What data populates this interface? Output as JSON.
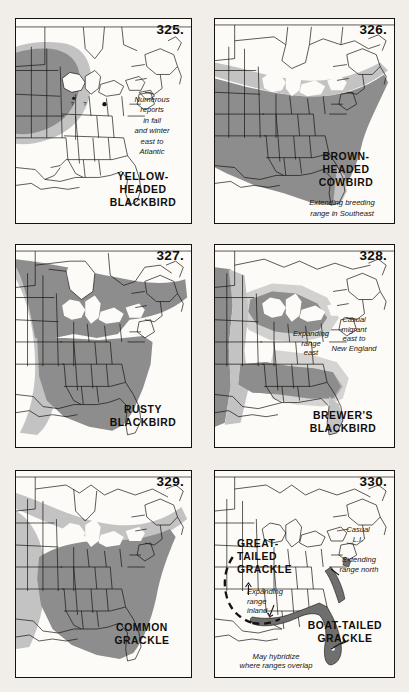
{
  "page": {
    "background_color": "#f1ede8",
    "panel_background": "#fdfbf8",
    "ink_color": "#16130f",
    "shade_dark": "#8b8b8b",
    "shade_light": "#bdbdbd",
    "shade_mid": "#a3a3a3",
    "layout": "2 columns x 3 rows of bird range maps"
  },
  "panels": [
    {
      "number": "325.",
      "species": "YELLOW-\nHEADED\nBLACKBIRD",
      "notes": [
        "Numerous\nreports\nin fall\nand winter\neast to\nAtlantic"
      ],
      "range_shading": "dark gray over upper Great Plains / upper Midwest, light gray halo extending east"
    },
    {
      "number": "326.",
      "species": "BROWN-\nHEADED\nCOWBIRD",
      "notes": [
        "Extending breeding\nrange in Southeast"
      ],
      "range_shading": "dark gray over most of eastern and central United States, light gray band across southern Canada, light gray wedge over Florida"
    },
    {
      "number": "327.",
      "species": "RUSTY\nBLACKBIRD",
      "notes": [],
      "range_shading": "dark gray across boreal Canada and down the eastern United States, light gray across the Great Plains"
    },
    {
      "number": "328.",
      "species": "BREWER'S\nBLACKBIRD",
      "notes": [
        "Expanding\nrange\neast",
        "Casual\nmigrant\neast to\nNew England"
      ],
      "range_shading": "dark gray over the western Great Lakes and Gulf coast states, light gray expansion zone eastward"
    },
    {
      "number": "329.",
      "species": "COMMON\nGRACKLE",
      "notes": [],
      "range_shading": "dark gray over eastern United States, light gray band over southern Canada and Great Plains"
    },
    {
      "number": "330.",
      "species_primary": "GREAT-\nTAILED\nGRACKLE",
      "species_secondary": "BOAT-TAILED\nGRACKLE",
      "notes": [
        "Expanding\nrange\ninland",
        "Casual\nL.I.",
        "Extending\nrange north",
        "May hybridize\nwhere ranges overlap"
      ],
      "range_shading": "dark gray along the Gulf and South Atlantic coast plus Florida; dashed boundary line in Texas for the Great-tailed Grackle"
    }
  ]
}
